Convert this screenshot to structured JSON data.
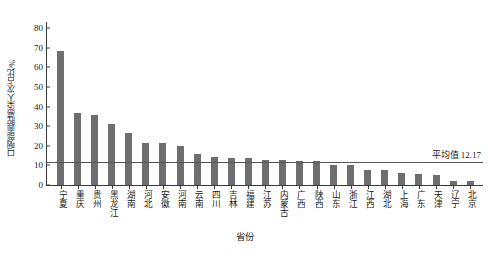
{
  "chart_data": {
    "type": "bar",
    "title": "",
    "xlabel": "省份",
    "ylabel": "口咽部面腔感染人次占比/%",
    "ylim": [
      0,
      80
    ],
    "yticks": [
      0,
      10,
      20,
      30,
      40,
      50,
      60,
      70,
      80
    ],
    "grid": false,
    "legend_position": "none",
    "bar_color": "#6e6e6e",
    "categories": [
      "宁夏",
      "重庆",
      "贵州",
      "黑龙江",
      "湖南",
      "河北",
      "安徽",
      "河南",
      "云南",
      "四川",
      "吉林",
      "福建",
      "江苏",
      "内蒙古",
      "广西",
      "陕西",
      "山东",
      "浙江",
      "江西",
      "湖北",
      "上海",
      "广东",
      "天津",
      "辽宁",
      "北京"
    ],
    "values": [
      68.5,
      36.5,
      35.5,
      31.0,
      26.5,
      21.5,
      21.2,
      20.0,
      16.0,
      14.5,
      14.0,
      13.6,
      12.8,
      12.8,
      12.2,
      12.2,
      10.3,
      10.0,
      7.8,
      7.5,
      6.0,
      5.5,
      5.0,
      2.2,
      1.8
    ],
    "annotations": [
      {
        "name": "mean-line",
        "label": "平均值  12.17",
        "value": 12.17
      }
    ]
  }
}
